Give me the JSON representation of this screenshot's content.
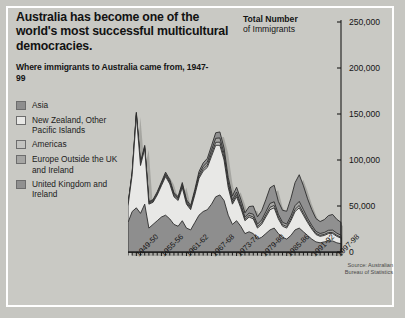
{
  "headline": "Australia has become one of the world's most successful multicultural democracies.",
  "subhead": "Where immigrants to Australia came from, 1947-99",
  "chart_title_bold": "Total Number",
  "chart_title_rest": "of Immigrants",
  "source": "Source: Australian Bureau of Statistics",
  "legend": [
    {
      "label": "Asia",
      "color": "#8e8e8e"
    },
    {
      "label": "New Zealand, Other Pacific Islands",
      "color": "#e8e8e6"
    },
    {
      "label": "Americas",
      "color": "#c3c3c0"
    },
    {
      "label": "Europe Outside the UK and Ireland",
      "color": "#a6a6a4"
    },
    {
      "label": "United Kingdom and Ireland",
      "color": "#909090"
    }
  ],
  "chart_data": {
    "type": "area",
    "title": "Total Number of Immigrants",
    "xlabel": "",
    "ylabel": "Total Number of Immigrants",
    "ylim": [
      0,
      250000
    ],
    "yticks": [
      0,
      50000,
      100000,
      150000,
      200000,
      250000
    ],
    "ytick_labels": [
      "0",
      "50,000",
      "100,000",
      "150,000",
      "200,000",
      "250,000"
    ],
    "grid": false,
    "legend_position": "left",
    "stacked": true,
    "x": [
      "1947-48",
      "1948-49",
      "1949-50",
      "1950-51",
      "1951-52",
      "1952-53",
      "1953-54",
      "1954-55",
      "1955-56",
      "1956-57",
      "1957-58",
      "1958-59",
      "1959-60",
      "1960-61",
      "1961-62",
      "1962-63",
      "1963-64",
      "1964-65",
      "1965-66",
      "1966-67",
      "1967-68",
      "1968-69",
      "1969-70",
      "1970-71",
      "1971-72",
      "1972-73",
      "1973-74",
      "1974-75",
      "1975-76",
      "1976-77",
      "1977-78",
      "1978-79",
      "1979-80",
      "1980-81",
      "1981-82",
      "1982-83",
      "1983-84",
      "1984-85",
      "1985-86",
      "1986-87",
      "1987-88",
      "1988-89",
      "1989-90",
      "1990-91",
      "1991-92",
      "1992-93",
      "1993-94",
      "1994-95",
      "1995-96",
      "1996-97",
      "1997-98",
      "1998-99"
    ],
    "xtick_labels": [
      "1949-50",
      "1955-56",
      "1961-62",
      "1967-68",
      "1973-74",
      "1979-80",
      "1985-86",
      "1991-92",
      "1997-98"
    ],
    "series": [
      {
        "name": "United Kingdom and Ireland",
        "values": [
          32000,
          44000,
          48000,
          42000,
          52000,
          26000,
          30000,
          34000,
          38000,
          40000,
          36000,
          30000,
          28000,
          34000,
          26000,
          24000,
          32000,
          40000,
          44000,
          46000,
          52000,
          60000,
          62000,
          56000,
          40000,
          30000,
          34000,
          28000,
          20000,
          22000,
          20000,
          14000,
          16000,
          20000,
          24000,
          26000,
          20000,
          16000,
          14000,
          18000,
          24000,
          26000,
          22000,
          18000,
          14000,
          11000,
          10000,
          11000,
          12000,
          12000,
          10000,
          9000
        ]
      },
      {
        "name": "Europe Outside the UK and Ireland",
        "values": [
          18000,
          40000,
          100000,
          52000,
          60000,
          26000,
          24000,
          28000,
          34000,
          42000,
          38000,
          30000,
          28000,
          36000,
          26000,
          22000,
          30000,
          40000,
          44000,
          46000,
          52000,
          56000,
          54000,
          44000,
          30000,
          22000,
          26000,
          20000,
          14000,
          16000,
          16000,
          12000,
          14000,
          18000,
          22000,
          22000,
          16000,
          12000,
          12000,
          16000,
          20000,
          22000,
          18000,
          14000,
          11000,
          8000,
          7000,
          7000,
          8000,
          8000,
          7000,
          6000
        ]
      },
      {
        "name": "Americas",
        "values": [
          600,
          900,
          1200,
          1000,
          1200,
          800,
          900,
          1000,
          1200,
          1400,
          1400,
          1200,
          1200,
          1500,
          1300,
          1200,
          1500,
          1900,
          2200,
          2400,
          2800,
          3200,
          3400,
          3000,
          2400,
          1800,
          2200,
          1900,
          1500,
          1800,
          2000,
          1600,
          1800,
          2200,
          2600,
          2600,
          2000,
          1700,
          1700,
          2000,
          2400,
          2600,
          2200,
          1800,
          1500,
          1200,
          1100,
          1100,
          1200,
          1200,
          1100,
          1000
        ]
      },
      {
        "name": "New Zealand, Other Pacific Islands",
        "values": [
          800,
          1100,
          1400,
          1200,
          1400,
          1000,
          1100,
          1300,
          1500,
          1700,
          1700,
          1500,
          1500,
          1900,
          1700,
          1600,
          2000,
          2500,
          2900,
          3200,
          3800,
          4400,
          4600,
          4000,
          3200,
          2600,
          3000,
          2600,
          2200,
          2600,
          3000,
          2600,
          3000,
          3600,
          4200,
          4000,
          3000,
          2600,
          2600,
          3200,
          4000,
          4400,
          3800,
          3000,
          2600,
          2200,
          2000,
          2100,
          2400,
          2600,
          2400,
          2200
        ]
      },
      {
        "name": "Asia",
        "values": [
          700,
          1000,
          1300,
          1100,
          1300,
          900,
          1000,
          1200,
          1400,
          1700,
          1700,
          1600,
          1600,
          2100,
          1900,
          1800,
          2400,
          3100,
          3700,
          4200,
          5000,
          6000,
          6500,
          6000,
          5200,
          4400,
          5200,
          5000,
          4800,
          7000,
          9000,
          8000,
          10000,
          13000,
          17000,
          18000,
          14000,
          13000,
          14000,
          19000,
          25000,
          29000,
          26000,
          21000,
          17000,
          14000,
          13000,
          14000,
          16000,
          17000,
          15000,
          14000
        ]
      }
    ],
    "totals_note": "Peak total approx 185,000 in 1969-70; second peak approx 145,000 in 1988-89"
  }
}
